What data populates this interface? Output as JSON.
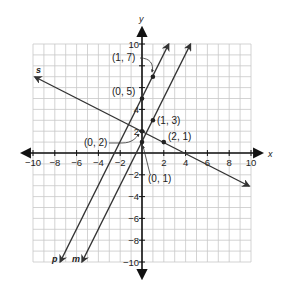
{
  "diagram": {
    "type": "coordinate-plane",
    "axes": {
      "x_label": "x",
      "y_label": "y",
      "range": [
        -10,
        10
      ],
      "tick_step": 2,
      "grid_step": 1
    },
    "x_ticks": [
      "−10",
      "−8",
      "−6",
      "−4",
      "−2",
      "2",
      "4",
      "6",
      "8",
      "10"
    ],
    "y_ticks": [
      "10",
      "8",
      "6",
      "4",
      "2",
      "−2",
      "−4",
      "−6",
      "−8",
      "−10"
    ],
    "lines": [
      {
        "name": "p",
        "equation": "y = 2x + 5",
        "points": [
          [
            0,
            5
          ],
          [
            1,
            7
          ]
        ]
      },
      {
        "name": "m",
        "equation": "y = 2x + 1",
        "points": [
          [
            0,
            1
          ],
          [
            1,
            3
          ]
        ]
      },
      {
        "name": "s",
        "equation": "y = -0.5x + 2",
        "points": [
          [
            0,
            2
          ],
          [
            2,
            1
          ]
        ]
      }
    ],
    "point_labels": {
      "p1": "(1, 7)",
      "p2": "(0, 5)",
      "m1": "(1, 3)",
      "m2": "(0, 1)",
      "s1": "(0, 2)",
      "s2": "(2, 1)"
    },
    "colors": {
      "grid": "#c8c8c8",
      "axis": "#111111",
      "line": "#333333",
      "point": "#222222"
    }
  }
}
